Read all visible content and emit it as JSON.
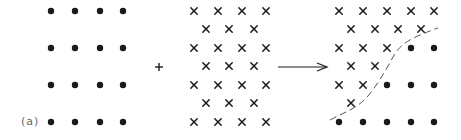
{
  "figure": {
    "label": "(a)",
    "operator_plus": "+",
    "colors": {
      "ink": "#1a1a1a",
      "label": "#666666",
      "dash": "#555555"
    },
    "panel_dots": {
      "description": "square lattice of filled dots, 4 columns x 4 rows",
      "xs": [
        51,
        75,
        100,
        123
      ],
      "ys": [
        11,
        48,
        85,
        122
      ]
    },
    "panel_crosses": {
      "description": "staggered lattice of crosses, 7 rows",
      "rows": [
        {
          "y": 11,
          "xs": [
            194,
            218,
            242,
            266
          ]
        },
        {
          "y": 29,
          "xs": [
            206,
            229,
            254
          ]
        },
        {
          "y": 48,
          "xs": [
            194,
            218,
            242,
            266
          ]
        },
        {
          "y": 66,
          "xs": [
            206,
            229,
            254
          ]
        },
        {
          "y": 85,
          "xs": [
            194,
            218,
            242,
            266
          ]
        },
        {
          "y": 103,
          "xs": [
            206,
            229,
            254
          ]
        },
        {
          "y": 122,
          "xs": [
            194,
            218,
            242,
            266
          ]
        }
      ]
    },
    "plus": {
      "x": 159,
      "y": 67
    },
    "arrow": {
      "x1": 278,
      "x2": 327,
      "y": 67
    },
    "panel_result": {
      "description": "combined lattice: crosses upper-left, dots lower-right, separated by dashed boundary",
      "crosses": [
        {
          "y": 11,
          "xs": [
            339,
            363,
            387,
            411,
            434
          ]
        },
        {
          "y": 29,
          "xs": [
            351,
            375,
            398,
            421
          ]
        },
        {
          "y": 48,
          "xs": [
            339,
            363,
            387
          ]
        },
        {
          "y": 66,
          "xs": [
            351,
            375
          ]
        },
        {
          "y": 85,
          "xs": [
            339,
            363
          ]
        },
        {
          "y": 103,
          "xs": [
            351
          ]
        }
      ],
      "dots": [
        {
          "y": 48,
          "xs": [
            411,
            434
          ]
        },
        {
          "y": 85,
          "xs": [
            387,
            411,
            434
          ]
        },
        {
          "y": 122,
          "xs": [
            339,
            363,
            387,
            411,
            434
          ]
        }
      ],
      "boundary_path": "M 330 120 C 345 112, 358 108, 368 96 C 378 84, 386 70, 393 57 C 400 44, 410 38, 438 28"
    }
  }
}
